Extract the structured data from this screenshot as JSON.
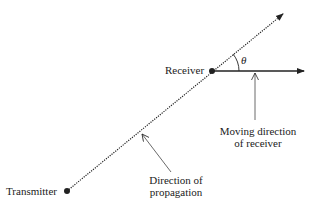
{
  "diagram": {
    "labels": {
      "transmitter": "Transmitter",
      "receiver": "Receiver",
      "theta": "θ",
      "moving_line1": "Moving direction",
      "moving_line2": "of receiver",
      "prop_line1": "Direction of",
      "prop_line2": "propagation"
    },
    "colors": {
      "ink": "#222222",
      "background": "#ffffff"
    }
  }
}
